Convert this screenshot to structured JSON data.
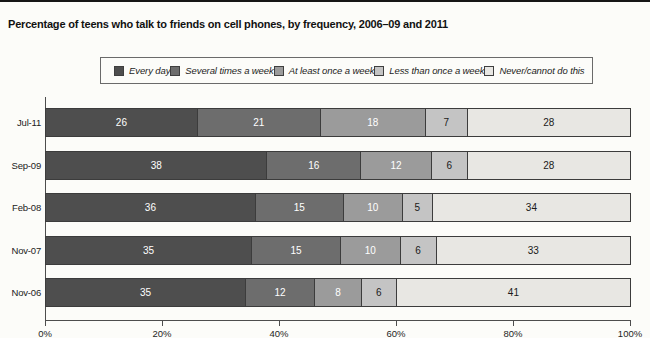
{
  "page": {
    "title": "Percentage of teens who talk to friends on cell phones, by frequency, 2006–09 and 2011"
  },
  "chart_data": {
    "type": "bar",
    "orientation": "horizontal",
    "stacked": true,
    "title": "Percentage of teens who talk to friends on cell phones, by frequency, 2006–09 and 2011",
    "categories": [
      "Jul-11",
      "Sep-09",
      "Feb-08",
      "Nov-07",
      "Nov-06"
    ],
    "series": [
      {
        "name": "Every day",
        "color": "#4e4e4e",
        "label_color": "#ffffff",
        "values": [
          26,
          38,
          36,
          35,
          35
        ]
      },
      {
        "name": "Several times a week",
        "color": "#6d6d6d",
        "label_color": "#ffffff",
        "values": [
          21,
          16,
          15,
          15,
          12
        ]
      },
      {
        "name": "At least once a week",
        "color": "#9b9b9b",
        "label_color": "#ffffff",
        "values": [
          18,
          12,
          10,
          10,
          8
        ]
      },
      {
        "name": "Less than once a week",
        "color": "#c4c4c4",
        "label_color": "#1a1a1a",
        "values": [
          7,
          6,
          5,
          6,
          6
        ]
      },
      {
        "name": "Never/cannot do this",
        "color": "#e8e7e3",
        "label_color": "#1a1a1a",
        "values": [
          28,
          28,
          34,
          33,
          41
        ]
      }
    ],
    "x_axis": {
      "tick_labels": [
        "0%",
        "20%",
        "40%",
        "60%",
        "80%",
        "100%"
      ],
      "tick_values": [
        0,
        20,
        40,
        60,
        80,
        100
      ],
      "range": [
        0,
        100
      ]
    },
    "legend_position": "top",
    "grid": false,
    "data_labels": "inside"
  }
}
